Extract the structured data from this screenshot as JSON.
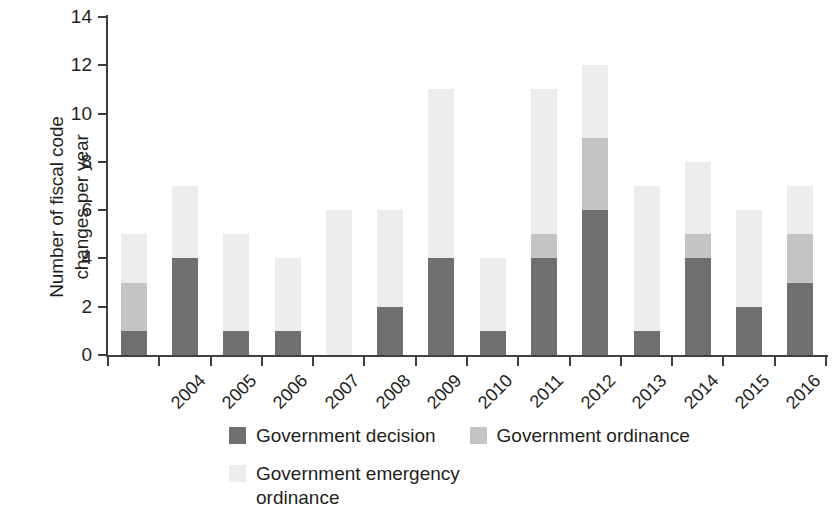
{
  "chart_data": {
    "type": "bar",
    "subtype": "stacked-bar",
    "title": "",
    "xlabel": "",
    "ylabel": "Number of fiscal code\nchanges per year",
    "ylim": [
      0,
      14
    ],
    "ytick_labels": [
      "0",
      "2",
      "4",
      "6",
      "8",
      "10",
      "12",
      "14"
    ],
    "ytick_values": [
      0,
      2,
      4,
      6,
      8,
      10,
      12,
      14
    ],
    "grid": false,
    "legend_position": "bottom",
    "categories": [
      "2004",
      "2005",
      "2006",
      "2007",
      "2008",
      "2009",
      "2010",
      "2011",
      "2012",
      "2013",
      "2014",
      "2015",
      "2016",
      "2017"
    ],
    "series": [
      {
        "name": "Government decision",
        "color": "#6f6f6f",
        "values": [
          1,
          4,
          1,
          1,
          0,
          2,
          4,
          1,
          4,
          6,
          1,
          4,
          2,
          3
        ]
      },
      {
        "name": "Government ordinance",
        "color": "#c4c4c4",
        "values": [
          2,
          0,
          0,
          0,
          0,
          0,
          0,
          0,
          1,
          3,
          0,
          1,
          0,
          2
        ]
      },
      {
        "name": "Government emergency\nordinance",
        "color": "#ececec",
        "values": [
          2,
          3,
          4,
          3,
          6,
          4,
          7,
          3,
          6,
          3,
          6,
          3,
          4,
          2
        ]
      }
    ],
    "totals": [
      5,
      7,
      5,
      4,
      6,
      6,
      11,
      4,
      11,
      12,
      7,
      8,
      6,
      7
    ]
  },
  "legend": {
    "items": [
      {
        "label": "Government decision",
        "color": "#6f6f6f"
      },
      {
        "label": "Government ordinance",
        "color": "#c4c4c4"
      },
      {
        "label": "Government emergency\nordinance",
        "color": "#ececec"
      }
    ]
  },
  "axes": {
    "y_title": "Number of fiscal code\nchanges per year"
  }
}
